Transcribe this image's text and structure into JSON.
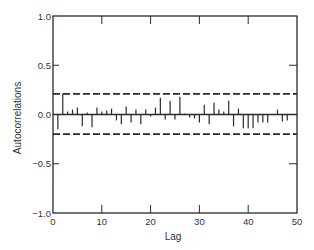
{
  "chart_data": {
    "type": "bar",
    "subtype": "autocorrelation-stem",
    "title": "",
    "xlabel": "Lag",
    "ylabel": "Autocorrelations",
    "xlim": [
      0,
      50
    ],
    "ylim": [
      -1.0,
      1.0
    ],
    "xticks": [
      0,
      10,
      20,
      30,
      40,
      50
    ],
    "xtick_labels": [
      "0",
      "10",
      "20",
      "30",
      "40",
      "50"
    ],
    "yticks": [
      -1.0,
      -0.5,
      0.0,
      0.5,
      1.0
    ],
    "ytick_labels": [
      "−1.0",
      "−0.5",
      "0.0",
      "0.5",
      "1.0"
    ],
    "grid": false,
    "confidence_bounds": {
      "upper": 0.21,
      "lower": -0.2,
      "style": "dashed"
    },
    "lags": [
      1,
      2,
      3,
      4,
      5,
      6,
      7,
      8,
      9,
      10,
      11,
      12,
      13,
      14,
      15,
      16,
      17,
      18,
      19,
      20,
      21,
      22,
      23,
      24,
      25,
      26,
      27,
      28,
      29,
      30,
      31,
      32,
      33,
      34,
      35,
      36,
      37,
      38,
      39,
      40,
      41,
      42,
      43,
      44,
      45,
      46,
      47,
      48,
      49
    ],
    "values": [
      -0.15,
      0.21,
      0.03,
      0.05,
      0.07,
      -0.12,
      0.02,
      -0.13,
      0.07,
      0.03,
      0.04,
      0.06,
      -0.06,
      -0.1,
      0.08,
      -0.08,
      0.05,
      -0.1,
      0.05,
      -0.02,
      0.07,
      0.17,
      -0.05,
      0.14,
      -0.05,
      0.18,
      0.01,
      -0.03,
      -0.04,
      -0.08,
      0.1,
      -0.1,
      0.12,
      0.05,
      0.03,
      0.14,
      -0.12,
      0.06,
      -0.14,
      -0.14,
      -0.14,
      -0.08,
      -0.08,
      -0.08,
      0.0,
      0.05,
      -0.07,
      -0.06,
      0.0
    ]
  },
  "labels": {
    "xlabel": "Lag",
    "ylabel": "Autocorrelations"
  }
}
